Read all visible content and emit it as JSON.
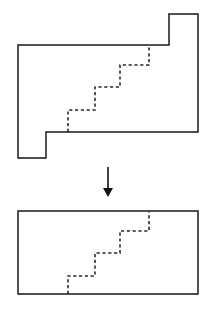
{
  "figure": {
    "title": "",
    "background_color": "#ffffff",
    "line_color": "#1a1a1a",
    "dashed_line_color": "#2b2b2b",
    "arrow_color": "#141414",
    "width": 208,
    "height": 315
  },
  "panels": {
    "top": {
      "label": "",
      "shape_name": "notched-polygon",
      "outline_points": "18,45 169,45 169,14 198,14 198,132 46,132 46,158 18,158",
      "dashed_path": "M 68,132 L 68,110 L 95,110 L 95,87 L 120,87 L 120,65 L 149,65 L 149,45"
    },
    "bottom": {
      "label": "",
      "shape_name": "rectangle",
      "outline_points": "18,211 198,211 198,294 18,294",
      "dashed_path": "M 68,294 L 68,276 L 95,276 L 95,253 L 120,253 L 120,231 L 149,231 L 149,211"
    }
  },
  "arrow": {
    "label": "",
    "direction": "down",
    "shaft_x": 108,
    "shaft_top_y": 167,
    "shaft_bottom_y": 189,
    "head_points": "103,188 113,188 108,197"
  }
}
